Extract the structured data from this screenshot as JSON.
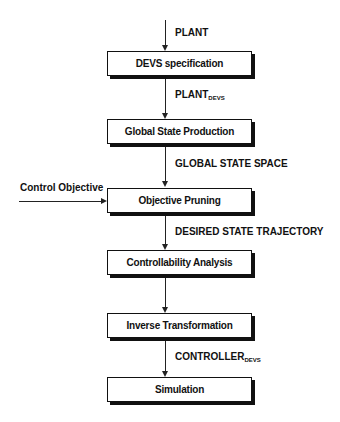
{
  "diagram": {
    "type": "flowchart",
    "boxes": [
      {
        "id": "devs",
        "label": "DEVS specification"
      },
      {
        "id": "global",
        "label": "Global State Production"
      },
      {
        "id": "objective",
        "label": "Objective Pruning"
      },
      {
        "id": "control",
        "label": "Controllability Analysis"
      },
      {
        "id": "inverse",
        "label": "Inverse Transformation"
      },
      {
        "id": "sim",
        "label": "Simulation"
      }
    ],
    "edges": [
      {
        "to": "devs",
        "label": "PLANT",
        "sub": ""
      },
      {
        "from": "devs",
        "to": "global",
        "label": "PLANT",
        "sub": "DEVS"
      },
      {
        "from": "global",
        "to": "objective",
        "label": "GLOBAL STATE SPACE",
        "sub": ""
      },
      {
        "from": "objective",
        "to": "control",
        "label": "DESIRED STATE TRAJECTORY",
        "sub": ""
      },
      {
        "from": "control",
        "to": "inverse",
        "label": "",
        "sub": ""
      },
      {
        "from": "inverse",
        "to": "sim",
        "label": "CONTROLLER",
        "sub": "DEVS"
      }
    ],
    "side_input": {
      "to": "objective",
      "label": "Control Objective"
    }
  }
}
